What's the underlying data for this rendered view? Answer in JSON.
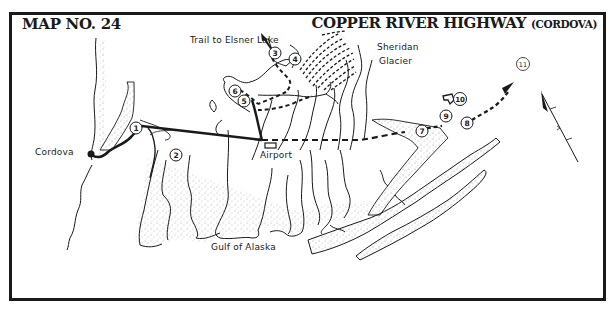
{
  "header": {
    "map_number": "MAP NO. 24",
    "title": "COPPER RIVER HIGHWAY",
    "subtitle": "(CORDOVA)"
  },
  "labels": {
    "trail": "Trail to Elsner Lake",
    "glacier_line1": "Sheridan",
    "glacier_line2": "Glacier",
    "town": "Cordova",
    "airport": "Airport",
    "sea": "Gulf of Alaska"
  },
  "markers": [
    {
      "id": "1",
      "label": "1"
    },
    {
      "id": "2",
      "label": "2"
    },
    {
      "id": "3",
      "label": "3"
    },
    {
      "id": "4",
      "label": "4"
    },
    {
      "id": "5",
      "label": "5"
    },
    {
      "id": "6",
      "label": "6"
    },
    {
      "id": "7",
      "label": "7"
    },
    {
      "id": "8",
      "label": "8"
    },
    {
      "id": "9",
      "label": "9"
    },
    {
      "id": "10",
      "label": "10"
    },
    {
      "id": "11",
      "label": "11"
    }
  ],
  "colors": {
    "ink": "#1a1a1a",
    "paper": "#ffffff"
  }
}
